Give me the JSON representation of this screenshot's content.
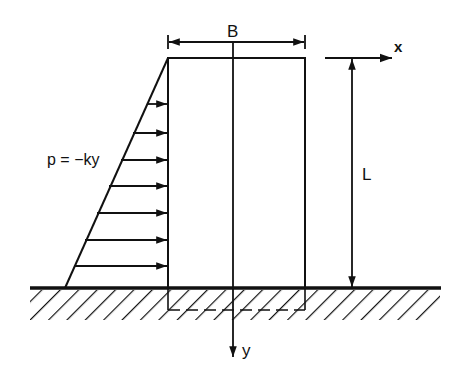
{
  "diagram": {
    "labels": {
      "width": "B",
      "height": "L",
      "x_axis": "x",
      "y_axis": "y",
      "pressure": "p = −ky"
    },
    "colors": {
      "stroke": "#111111",
      "background": "#ffffff"
    },
    "geometry": {
      "wall": {
        "x1": 168,
        "y1": 58,
        "x2": 305,
        "y2": 288
      },
      "ground_y": 288,
      "triangle_base_x": 65,
      "arrow_ys": [
        102,
        131,
        160,
        187,
        214,
        241,
        267
      ]
    }
  }
}
